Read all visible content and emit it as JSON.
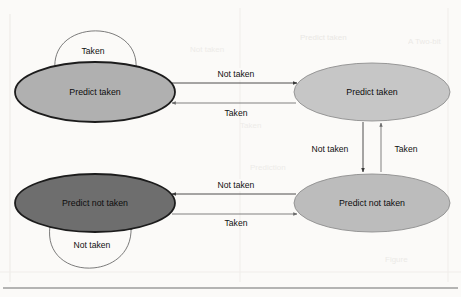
{
  "figure": {
    "type": "state-diagram",
    "background_color": "#fbfaf8",
    "bottom_rule_color": "#6f6f6f"
  },
  "states": [
    {
      "id": "strong-taken",
      "label": "Predict taken",
      "position": "top-left",
      "fill": "#b0b0b0",
      "stroke": "#1c1c1c",
      "stroke_width": 1.8,
      "cx": 95,
      "cy": 92,
      "rx": 80,
      "ry": 30
    },
    {
      "id": "weak-taken",
      "label": "Predict taken",
      "position": "top-right",
      "fill": "#c6c6c6",
      "stroke": "#8e8e8e",
      "stroke_width": 0.9,
      "cx": 372,
      "cy": 92,
      "rx": 78,
      "ry": 29
    },
    {
      "id": "strong-not-taken",
      "label": "Predict not taken",
      "position": "bottom-left",
      "fill": "#6e6e6e",
      "stroke": "#1c1c1c",
      "stroke_width": 1.8,
      "cx": 95,
      "cy": 203,
      "rx": 80,
      "ry": 29
    },
    {
      "id": "weak-not-taken",
      "label": "Predict not taken",
      "position": "bottom-right",
      "fill": "#bcbcbc",
      "stroke": "#8e8e8e",
      "stroke_width": 0.9,
      "cx": 372,
      "cy": 203,
      "rx": 78,
      "ry": 29
    }
  ],
  "transitions": [
    {
      "id": "t1",
      "from": "strong-taken",
      "to": "weak-taken",
      "label": "Not taken",
      "direction": "right",
      "label_x": 236,
      "label_y": 76
    },
    {
      "id": "t2",
      "from": "weak-taken",
      "to": "strong-taken",
      "label": "Taken",
      "direction": "left",
      "label_x": 236,
      "label_y": 112
    },
    {
      "id": "t3",
      "from": "weak-taken",
      "to": "weak-not-taken",
      "label": "Not taken",
      "direction": "down",
      "label_x": 330,
      "label_y": 150
    },
    {
      "id": "t4",
      "from": "weak-not-taken",
      "to": "weak-taken",
      "label": "Taken",
      "direction": "up",
      "label_x": 404,
      "label_y": 150
    },
    {
      "id": "t5",
      "from": "weak-not-taken",
      "to": "strong-not-taken",
      "label": "Not taken",
      "direction": "left",
      "label_x": 236,
      "label_y": 187
    },
    {
      "id": "t6",
      "from": "strong-not-taken",
      "to": "weak-not-taken",
      "label": "Taken",
      "direction": "right",
      "label_x": 236,
      "label_y": 222
    }
  ],
  "self_loops": [
    {
      "id": "loop-taken",
      "state": "strong-taken",
      "label": "Taken",
      "label_x": 93,
      "label_y": 52,
      "placement": "above"
    },
    {
      "id": "loop-not-taken",
      "state": "strong-not-taken",
      "label": "Not taken",
      "label_x": 92,
      "label_y": 246,
      "placement": "below"
    }
  ],
  "watermarks": [
    {
      "text": "Predict taken",
      "x": 300,
      "y": 40,
      "size": 8,
      "opacity": 0.5
    },
    {
      "text": "A Two-bit",
      "x": 420,
      "y": 44,
      "size": 8,
      "opacity": 0.45
    },
    {
      "text": "Not taken",
      "x": 200,
      "y": 52,
      "size": 8,
      "opacity": 0.4
    },
    {
      "text": "Taken",
      "x": 245,
      "y": 128,
      "size": 8,
      "opacity": 0.4
    },
    {
      "text": "Prediction",
      "x": 260,
      "y": 170,
      "size": 8,
      "opacity": 0.4
    },
    {
      "text": "Figure",
      "x": 395,
      "y": 262,
      "size": 8,
      "opacity": 0.45
    }
  ]
}
